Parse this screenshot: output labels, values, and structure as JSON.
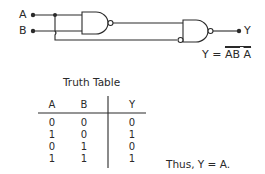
{
  "circuit": {
    "inputs": [
      {
        "label": "A"
      },
      {
        "label": "B"
      }
    ],
    "output": {
      "label": "Y"
    },
    "gates": [
      {
        "type": "NAND",
        "name": "gate1"
      },
      {
        "type": "NAND",
        "name": "gate2"
      }
    ],
    "equation": {
      "lhs": "Y",
      "eq": "=",
      "term1": "AB",
      "term2": "A"
    }
  },
  "truth_table": {
    "title": "Truth Table",
    "headers": [
      "A",
      "B",
      "Y"
    ],
    "rows": [
      [
        "0",
        "0",
        "0"
      ],
      [
        "1",
        "0",
        "1"
      ],
      [
        "0",
        "1",
        "0"
      ],
      [
        "1",
        "1",
        "1"
      ]
    ]
  },
  "conclusion": "Thus, Y = A."
}
